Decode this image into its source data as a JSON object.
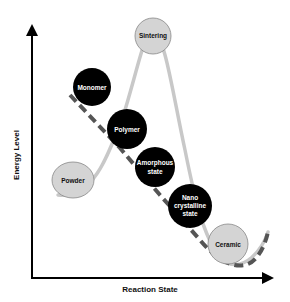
{
  "diagram": {
    "x_axis_label": "Reaction State",
    "y_axis_label": "Energy Level",
    "colors": {
      "axis": "#000000",
      "curve": "#c8c8c8",
      "dashed_path": "#555555",
      "dark_node": "#000000",
      "light_node": "#d4d4d4",
      "light_node_stroke": "#888888"
    },
    "nodes": [
      {
        "id": "sintering",
        "label": "Sintering",
        "style": "light"
      },
      {
        "id": "monomer",
        "label": "Monomer",
        "style": "dark"
      },
      {
        "id": "polymer",
        "label": "Polymer",
        "style": "dark"
      },
      {
        "id": "powder",
        "label": "Powder",
        "style": "light"
      },
      {
        "id": "amorphous",
        "label_lines": [
          "Amorphous",
          "state"
        ],
        "style": "dark"
      },
      {
        "id": "nano",
        "label_lines": [
          "Nano",
          "crystalline",
          "state"
        ],
        "style": "dark"
      },
      {
        "id": "ceramic",
        "label": "Ceramic",
        "style": "light"
      }
    ]
  }
}
